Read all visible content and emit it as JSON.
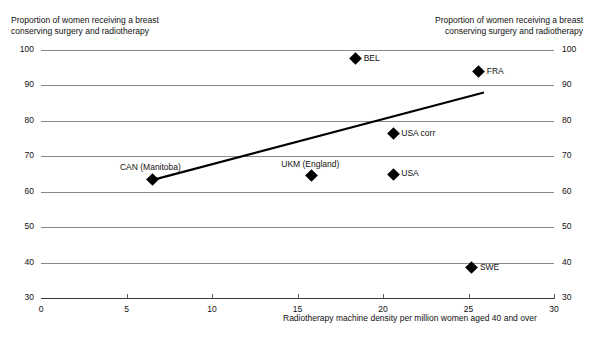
{
  "chart_data": {
    "type": "scatter",
    "title": "Proportion of women receiving a breast conserving surgery and radiotherapy",
    "title_left": "Proportion of women receiving a breast\nconserving surgery and radiotherapy",
    "title_right": "Proportion of women receiving a breast\nconserving surgery and radiotherapy",
    "xlabel": "Radiotherapy machine density per million women aged 40 and over",
    "ylabel": "Proportion of women receiving a breast conserving surgery and radiotherapy",
    "xlim": [
      0,
      30
    ],
    "ylim": [
      30,
      100
    ],
    "xticks": [
      0,
      5,
      10,
      15,
      20,
      25,
      30
    ],
    "yticks": [
      30,
      40,
      50,
      60,
      70,
      80,
      90,
      100
    ],
    "xtick_labels": [
      "0",
      "5",
      "10",
      "15",
      "20",
      "25",
      "30"
    ],
    "ytick_labels": [
      "30",
      "40",
      "50",
      "60",
      "70",
      "80",
      "90",
      "100"
    ],
    "grid": true,
    "legend": "none",
    "marker": "diamond",
    "marker_color": "#000000",
    "grid_color": "#8a8a8a",
    "axis_color": "#3a3a3a",
    "points": [
      {
        "label": "CAN (Manitoba)",
        "x": 6.5,
        "y": 63.5,
        "label_pos": "above"
      },
      {
        "label": "UKM (England)",
        "x": 15.8,
        "y": 64.5,
        "label_pos": "above"
      },
      {
        "label": "BEL",
        "x": 18.4,
        "y": 97.5,
        "label_pos": "right"
      },
      {
        "label": "USA corr",
        "x": 20.6,
        "y": 76.3,
        "label_pos": "right"
      },
      {
        "label": "USA",
        "x": 20.6,
        "y": 65.0,
        "label_pos": "right"
      },
      {
        "label": "SWE",
        "x": 25.2,
        "y": 38.5,
        "label_pos": "right"
      },
      {
        "label": "FRA",
        "x": 25.6,
        "y": 93.8,
        "label_pos": "right"
      }
    ],
    "trendline": {
      "type": "line",
      "x": [
        6.6,
        25.9
      ],
      "y": [
        63.4,
        88.0
      ],
      "color": "#000000",
      "width": 2.2
    }
  }
}
